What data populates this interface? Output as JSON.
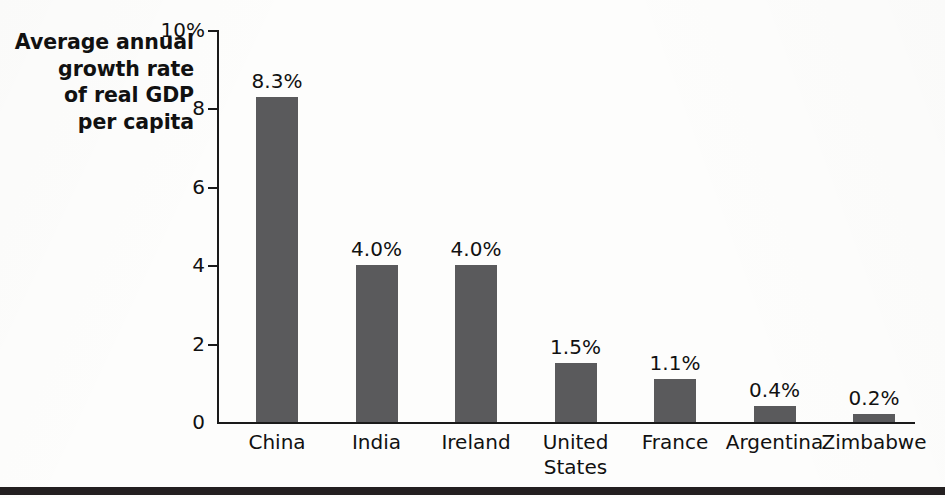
{
  "chart_data": {
    "type": "bar",
    "title": "",
    "subtitle": "",
    "xlabel": "",
    "ylabel": "Average annual growth rate of real GDP per capita",
    "ylabel_lines": [
      "Average annual",
      "growth rate",
      "of real GDP",
      "per capita"
    ],
    "categories": [
      "China",
      "India",
      "Ireland",
      "United States",
      "France",
      "Argentina",
      "Zimbabwe"
    ],
    "category_label_lines": [
      [
        "China"
      ],
      [
        "India"
      ],
      [
        "Ireland"
      ],
      [
        "United",
        "States"
      ],
      [
        "France"
      ],
      [
        "Argentina"
      ],
      [
        "Zimbabwe"
      ]
    ],
    "values": [
      8.3,
      4.0,
      4.0,
      1.5,
      1.1,
      0.4,
      0.2
    ],
    "value_labels": [
      "8.3%",
      "4.0%",
      "4.0%",
      "1.5%",
      "1.1%",
      "0.4%",
      "0.2%"
    ],
    "ylim": [
      0,
      10
    ],
    "ytick_values": [
      10,
      8,
      6,
      4,
      2,
      0
    ],
    "ytick_labels": [
      "10%",
      "8",
      "6",
      "4",
      "2",
      "0"
    ],
    "grid": false,
    "legend": null,
    "bar_color": "#5a5a5c",
    "axis_color": "#1a1a1a",
    "text_color": "#111111",
    "background_color": "#fdfdfc",
    "rule_color": "#231f20"
  }
}
